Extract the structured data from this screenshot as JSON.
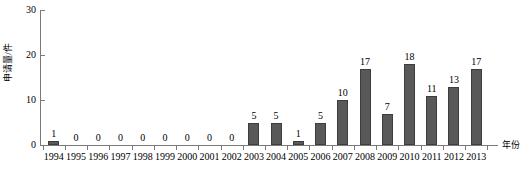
{
  "chart_data": {
    "type": "bar",
    "title": "",
    "xlabel": "年份",
    "ylabel": "申请量/件",
    "categories": [
      "1994",
      "1995",
      "1996",
      "1997",
      "1998",
      "1999",
      "2000",
      "2001",
      "2002",
      "2003",
      "2004",
      "2005",
      "2006",
      "2007",
      "2008",
      "2009",
      "2010",
      "2011",
      "2012",
      "2013"
    ],
    "values": [
      1,
      0,
      0,
      0,
      0,
      0,
      0,
      0,
      0,
      5,
      5,
      1,
      5,
      10,
      17,
      7,
      18,
      11,
      13,
      17
    ],
    "ylim": [
      0,
      30
    ],
    "yticks": [
      0,
      10,
      20,
      30
    ],
    "ytick_labels": [
      "0",
      "10",
      "20",
      "30"
    ],
    "grid": false,
    "legend": false,
    "data_labels": [
      "1",
      "0",
      "0",
      "0",
      "0",
      "0",
      "0",
      "0",
      "0",
      "5",
      "5",
      "1",
      "5",
      "10",
      "17",
      "7",
      "18",
      "11",
      "13",
      "17"
    ],
    "bar_color": "#595959",
    "bar_border_color": "#3d3d3d",
    "axis_color": "#7a7a7a",
    "background_color": "#ffffff"
  }
}
